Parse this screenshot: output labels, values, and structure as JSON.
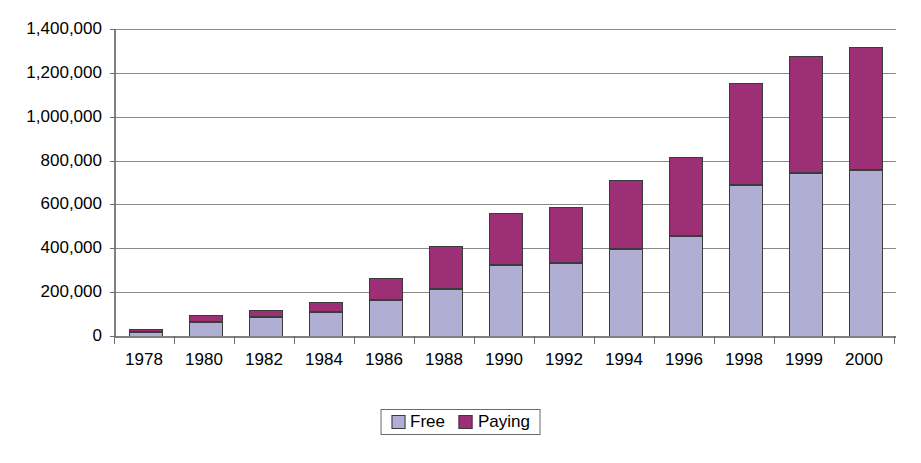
{
  "chart_data": {
    "type": "bar",
    "subtype": "stacked-column",
    "title": "",
    "xlabel": "",
    "ylabel": "",
    "categories": [
      "1978",
      "1980",
      "1982",
      "1984",
      "1986",
      "1988",
      "1990",
      "1992",
      "1994",
      "1996",
      "1998",
      "1999",
      "2000"
    ],
    "series": [
      {
        "name": "Free",
        "color": "#b0aed2",
        "values": [
          20000,
          62000,
          85000,
          110000,
          165000,
          215000,
          325000,
          335000,
          395000,
          455000,
          690000,
          745000,
          755000
        ]
      },
      {
        "name": "Paying",
        "color": "#9c2f76",
        "values": [
          12000,
          33000,
          35000,
          45000,
          100000,
          195000,
          235000,
          255000,
          315000,
          360000,
          465000,
          530000,
          565000
        ]
      }
    ],
    "totals": [
      32000,
      95000,
      120000,
      155000,
      265000,
      410000,
      560000,
      590000,
      710000,
      815000,
      1155000,
      1275000,
      1320000
    ],
    "ylim": [
      0,
      1400000
    ],
    "ytick_step": 200000,
    "ytick_labels": [
      "1,400,000",
      "1,200,000",
      "1,000,000",
      "800,000",
      "600,000",
      "400,000",
      "200,000",
      "0"
    ],
    "ytick_values": [
      1400000,
      1200000,
      1000000,
      800000,
      600000,
      400000,
      200000,
      0
    ],
    "grid": true,
    "grid_axis": "y",
    "legend": {
      "position": "bottom",
      "bordered": true,
      "entries": [
        {
          "label": "Free",
          "color": "#b0aed2"
        },
        {
          "label": "Paying",
          "color": "#9c2f76"
        }
      ]
    },
    "axis_color": "#808080",
    "grid_color": "#8a8a8a",
    "background": "#ffffff"
  }
}
